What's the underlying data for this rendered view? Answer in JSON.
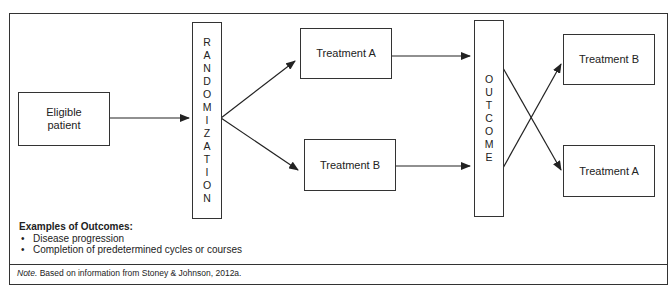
{
  "diagram": {
    "nodes": {
      "eligible": {
        "label_line1": "Eligible",
        "label_line2": "patient"
      },
      "randomization": {
        "letters": [
          "R",
          "A",
          "N",
          "D",
          "O",
          "M",
          "I",
          "Z",
          "A",
          "T",
          "I",
          "O",
          "N"
        ]
      },
      "treatment_a_first": {
        "label": "Treatment A"
      },
      "treatment_b_first": {
        "label": "Treatment B"
      },
      "outcome": {
        "letters": [
          "O",
          "U",
          "T",
          "C",
          "O",
          "M",
          "E"
        ]
      },
      "treatment_b_second": {
        "label": "Treatment B"
      },
      "treatment_a_second": {
        "label": "Treatment A"
      }
    },
    "edges": [
      {
        "from": "Eligible patient",
        "to": "RANDOMIZATION"
      },
      {
        "from": "RANDOMIZATION",
        "to": "Treatment A"
      },
      {
        "from": "RANDOMIZATION",
        "to": "Treatment B"
      },
      {
        "from": "Treatment A",
        "to": "OUTCOME"
      },
      {
        "from": "Treatment B",
        "to": "OUTCOME"
      },
      {
        "from": "OUTCOME (upper)",
        "to": "Treatment A (crossover)"
      },
      {
        "from": "OUTCOME (lower)",
        "to": "Treatment B (crossover)"
      }
    ]
  },
  "examples": {
    "title": "Examples of Outcomes:",
    "items": [
      "Disease progression",
      "Completion of predetermined cycles or courses"
    ]
  },
  "note": {
    "label": "Note.",
    "text": " Based on information from Stoney & Johnson, 2012a."
  },
  "colors": {
    "line": "#333333",
    "background": "#ffffff"
  }
}
